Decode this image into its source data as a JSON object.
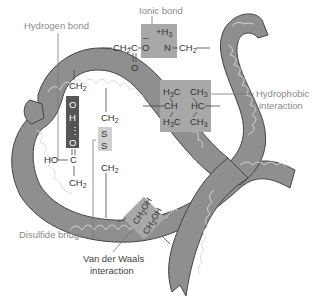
{
  "labels": {
    "hydrogen_bond": "Hydrogen bond",
    "ionic_bond": "Ionic bond",
    "hydrophobic_line1": "Hydrophobic",
    "hydrophobic_line2": "interaction",
    "disulfide_bridge": "Disulfide bridge",
    "vdw_line1": "Van der Waals",
    "vdw_line2": "interaction"
  },
  "ionic": {
    "left_chain": "CH",
    "left_chain_sub": "2",
    "carbon": "C",
    "carbonyl_o": "O",
    "anion": "O",
    "anion_charge": "–",
    "cation_charge": "+H",
    "cation_sub": "3",
    "nitrogen": "N",
    "right_chain": "CH",
    "right_chain_sub": "2"
  },
  "hbond": {
    "top_ch2": "CH",
    "top_ch2_sub": "2",
    "o1": "O",
    "h": "H",
    "dots": "⋮",
    "o2": "O",
    "ho": "HO",
    "c": "C",
    "bottom_ch2": "CH",
    "bottom_ch2_sub": "2"
  },
  "disulfide": {
    "top_ch2": "CH",
    "top_ch2_sub": "2",
    "s1": "S",
    "s2": "S",
    "bottom_ch2": "CH",
    "bottom_ch2_sub": "2"
  },
  "hydrophobic": {
    "h3c_top": "H",
    "h3c_top_sub": "3",
    "h3c_top_c": "C",
    "ch3_top": "CH",
    "ch3_top_sub": "3",
    "ch": "CH",
    "hc": "HC",
    "h3c_bottom": "H",
    "h3c_bottom_sub": "3",
    "h3c_bottom_c": "C",
    "ch3_bottom": "CH",
    "ch3_bottom_sub": "3"
  },
  "vdw": {
    "group1": "CH",
    "group1_sub": "2",
    "group1_oh": "OH",
    "group2": "CH",
    "group2_sub": "2",
    "group2_oh": "OH"
  },
  "colors": {
    "ribbon": "#8f8f8f",
    "ribbon_outline": "#444444",
    "helix": "#d8d8d8",
    "box_light": "#a8a8a8",
    "box_dark": "#555555",
    "box_pale": "#d0d0d0",
    "label": "#8a8a8a"
  }
}
